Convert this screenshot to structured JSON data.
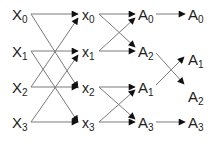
{
  "diagram": {
    "type": "butterfly / FFT signal-flow graph",
    "line_color": "#7a7a7a",
    "arrow_color": "#111111",
    "columns": [
      {
        "nodes": [
          {
            "id": "X0",
            "base": "X",
            "sub": "0",
            "x": 12,
            "y": 7
          },
          {
            "id": "X1",
            "base": "X",
            "sub": "1",
            "x": 12,
            "y": 44
          },
          {
            "id": "X2",
            "base": "X",
            "sub": "2",
            "x": 12,
            "y": 80
          },
          {
            "id": "X3",
            "base": "X",
            "sub": "3",
            "x": 12,
            "y": 115
          }
        ]
      },
      {
        "nodes": [
          {
            "id": "x0",
            "base": "x",
            "sub": "0",
            "x": 82,
            "y": 8
          },
          {
            "id": "x1",
            "base": "x",
            "sub": "1",
            "x": 82,
            "y": 45
          },
          {
            "id": "x2",
            "base": "x",
            "sub": "2",
            "x": 82,
            "y": 81
          },
          {
            "id": "x3",
            "base": "x",
            "sub": "3",
            "x": 82,
            "y": 116
          }
        ]
      },
      {
        "nodes": [
          {
            "id": "A0a",
            "base": "A",
            "sub": "0",
            "x": 138,
            "y": 7
          },
          {
            "id": "A2a",
            "base": "A",
            "sub": "2",
            "x": 138,
            "y": 44
          },
          {
            "id": "A1a",
            "base": "A",
            "sub": "1",
            "x": 138,
            "y": 80
          },
          {
            "id": "A3a",
            "base": "A",
            "sub": "3",
            "x": 138,
            "y": 115
          }
        ]
      },
      {
        "nodes": [
          {
            "id": "A0b",
            "base": "A",
            "sub": "0",
            "x": 188,
            "y": 7
          },
          {
            "id": "A1b",
            "base": "A",
            "sub": "1",
            "x": 188,
            "y": 52
          },
          {
            "id": "A2b",
            "base": "A",
            "sub": "2",
            "x": 188,
            "y": 89
          },
          {
            "id": "A3b",
            "base": "A",
            "sub": "3",
            "x": 188,
            "y": 115
          }
        ]
      }
    ],
    "edges": [
      {
        "from": "X0",
        "to": "x0",
        "x1": 31,
        "y1": 14,
        "x2": 78,
        "y2": 14
      },
      {
        "from": "X0",
        "to": "x2",
        "x1": 31,
        "y1": 14,
        "x2": 78,
        "y2": 88
      },
      {
        "from": "X1",
        "to": "x1",
        "x1": 31,
        "y1": 51,
        "x2": 78,
        "y2": 51
      },
      {
        "from": "X1",
        "to": "x3",
        "x1": 31,
        "y1": 51,
        "x2": 78,
        "y2": 122
      },
      {
        "from": "X2",
        "to": "x0",
        "x1": 31,
        "y1": 87,
        "x2": 78,
        "y2": 18
      },
      {
        "from": "X2",
        "to": "x2",
        "x1": 31,
        "y1": 87,
        "x2": 78,
        "y2": 87
      },
      {
        "from": "X3",
        "to": "x1",
        "x1": 31,
        "y1": 122,
        "x2": 78,
        "y2": 55
      },
      {
        "from": "X3",
        "to": "x3",
        "x1": 31,
        "y1": 122,
        "x2": 78,
        "y2": 122
      },
      {
        "from": "x0",
        "to": "A0a",
        "x1": 99,
        "y1": 14,
        "x2": 135,
        "y2": 14
      },
      {
        "from": "x0",
        "to": "A2a",
        "x1": 99,
        "y1": 14,
        "x2": 135,
        "y2": 47
      },
      {
        "from": "x1",
        "to": "A0a",
        "x1": 99,
        "y1": 51,
        "x2": 135,
        "y2": 18
      },
      {
        "from": "x1",
        "to": "A2a",
        "x1": 99,
        "y1": 51,
        "x2": 135,
        "y2": 51
      },
      {
        "from": "x2",
        "to": "A1a",
        "x1": 99,
        "y1": 87,
        "x2": 135,
        "y2": 87
      },
      {
        "from": "x2",
        "to": "A3a",
        "x1": 99,
        "y1": 87,
        "x2": 135,
        "y2": 119
      },
      {
        "from": "x3",
        "to": "A1a",
        "x1": 99,
        "y1": 122,
        "x2": 135,
        "y2": 90
      },
      {
        "from": "x3",
        "to": "A3a",
        "x1": 99,
        "y1": 122,
        "x2": 135,
        "y2": 122
      },
      {
        "from": "A0a",
        "to": "A0b",
        "x1": 156,
        "y1": 14,
        "x2": 185,
        "y2": 14
      },
      {
        "from": "A2a",
        "to": "A2b",
        "x1": 156,
        "y1": 53,
        "x2": 184,
        "y2": 84
      },
      {
        "from": "A1a",
        "to": "A1b",
        "x1": 156,
        "y1": 85,
        "x2": 184,
        "y2": 57
      },
      {
        "from": "A3a",
        "to": "A3b",
        "x1": 156,
        "y1": 122,
        "x2": 185,
        "y2": 122
      }
    ]
  }
}
